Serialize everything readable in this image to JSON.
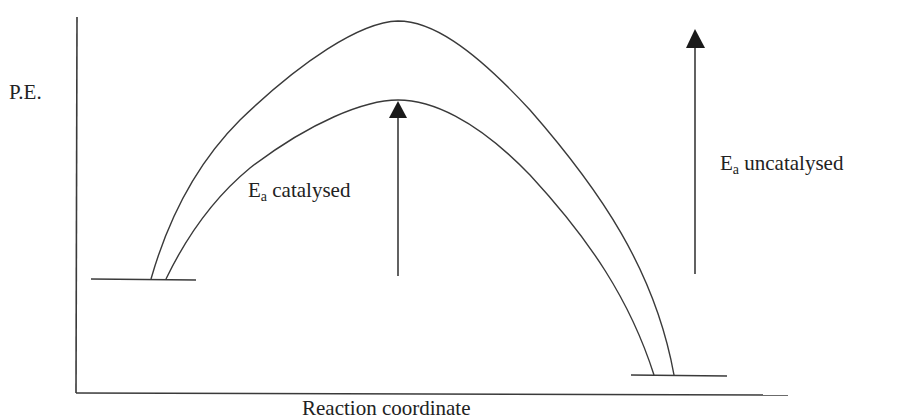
{
  "diagram": {
    "type": "energy-profile",
    "y_axis_label": "P.E.",
    "x_axis_label": "Reaction coordinate",
    "catalysed_label": {
      "symbol": "E",
      "subscript": "a",
      "text": "catalysed"
    },
    "uncatalysed_label": {
      "symbol": "E",
      "subscript": "a",
      "text": "uncatalysed"
    },
    "colors": {
      "line": "#3a3a3a",
      "text": "#222222",
      "background": "#ffffff"
    },
    "curves": [
      {
        "name": "uncatalysed",
        "start": [
          151,
          279
        ],
        "peak": [
          398,
          21
        ],
        "end": [
          674,
          375
        ]
      },
      {
        "name": "catalysed",
        "start": [
          166,
          279
        ],
        "peak": [
          398,
          100
        ],
        "end": [
          654,
          375
        ]
      }
    ],
    "levels": {
      "reactants": {
        "y": 279,
        "x1": 91,
        "x2": 196
      },
      "products": {
        "y": 375,
        "x1": 631,
        "x2": 727
      }
    },
    "arrows": [
      {
        "name": "catalysed-activation-arrow",
        "x": 398,
        "y_from": 276,
        "y_to": 101
      },
      {
        "name": "uncatalysed-activation-arrow",
        "x": 695,
        "y_from": 274,
        "y_to": 29
      }
    ]
  }
}
